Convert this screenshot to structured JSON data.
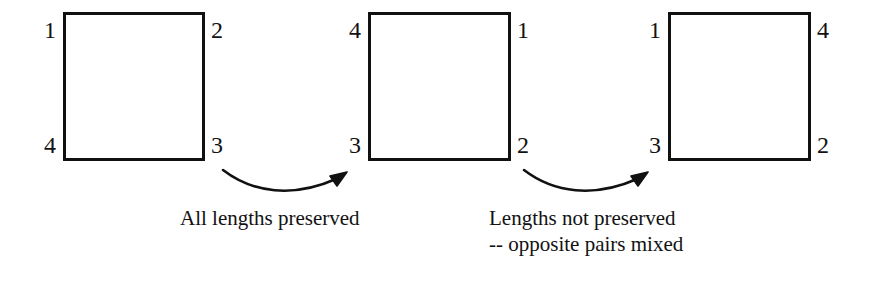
{
  "figure": {
    "background_color": "#ffffff",
    "stroke_color": "#111111",
    "text_color": "#121212"
  },
  "squares": [
    {
      "id": "square-1",
      "name": "original-square",
      "corners": {
        "top_left": "1",
        "top_right": "2",
        "bottom_right": "3",
        "bottom_left": "4"
      }
    },
    {
      "id": "square-2",
      "name": "rotated-square",
      "corners": {
        "top_left": "4",
        "top_right": "1",
        "bottom_right": "2",
        "bottom_left": "3"
      }
    },
    {
      "id": "square-3",
      "name": "mixed-square",
      "corners": {
        "top_left": "1",
        "top_right": "4",
        "bottom_right": "2",
        "bottom_left": "3"
      }
    }
  ],
  "arrows": [
    {
      "id": "arrow-1",
      "name": "transform-arrow-first",
      "direction": "left-to-right-curved-up"
    },
    {
      "id": "arrow-2",
      "name": "transform-arrow-second",
      "direction": "left-to-right-curved-up"
    }
  ],
  "captions": {
    "first": {
      "lines": [
        "All lengths preserved"
      ],
      "line1": "All lengths preserved"
    },
    "second": {
      "lines": [
        "Lengths not preserved",
        "-- opposite pairs mixed"
      ],
      "line1": "Lengths not preserved",
      "line2": "-- opposite pairs mixed"
    }
  }
}
